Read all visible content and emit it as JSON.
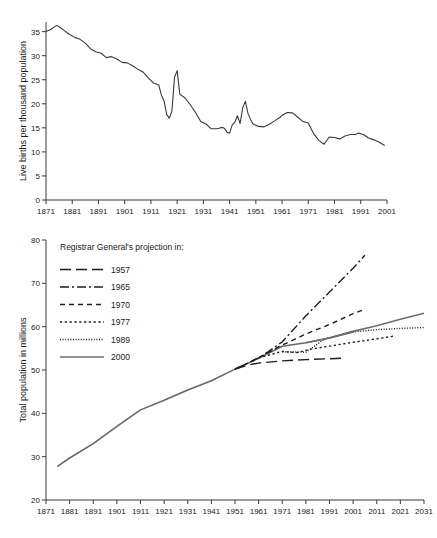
{
  "chart_data": [
    {
      "id": "birth-rate",
      "type": "line",
      "title": "",
      "xlabel": "",
      "ylabel": "Live births per thousand population",
      "xlim": [
        1871,
        2001
      ],
      "ylim": [
        0,
        37
      ],
      "yticks": [
        0,
        5,
        10,
        15,
        20,
        25,
        30,
        35
      ],
      "xticks": [
        1871,
        1881,
        1891,
        1901,
        1911,
        1921,
        1931,
        1941,
        1951,
        1961,
        1971,
        1981,
        1991,
        2001
      ],
      "grid": false,
      "legend": "none",
      "series": [
        {
          "name": "Live birth rate",
          "color": "#3a3a3a",
          "x": [
            1871,
            1873,
            1875,
            1876,
            1878,
            1880,
            1882,
            1884,
            1886,
            1888,
            1890,
            1892,
            1894,
            1896,
            1898,
            1900,
            1902,
            1904,
            1906,
            1908,
            1910,
            1912,
            1914,
            1915,
            1916,
            1917,
            1918,
            1919,
            1920,
            1921,
            1922,
            1924,
            1926,
            1928,
            1930,
            1932,
            1934,
            1936,
            1937,
            1938,
            1939,
            1940,
            1941,
            1942,
            1943,
            1944,
            1945,
            1946,
            1947,
            1948,
            1949,
            1950,
            1952,
            1954,
            1956,
            1958,
            1960,
            1961,
            1963,
            1965,
            1967,
            1969,
            1971,
            1973,
            1975,
            1977,
            1979,
            1981,
            1983,
            1985,
            1987,
            1989,
            1990,
            1992,
            1994,
            1996,
            1998,
            2000
          ],
          "values": [
            35.0,
            35.5,
            36.3,
            36.0,
            35.2,
            34.4,
            33.8,
            33.4,
            32.6,
            31.4,
            30.8,
            30.5,
            29.6,
            29.8,
            29.3,
            28.6,
            28.5,
            27.9,
            27.2,
            26.6,
            25.4,
            24.3,
            23.9,
            21.8,
            20.6,
            17.8,
            17.0,
            18.5,
            25.5,
            26.9,
            22.0,
            21.2,
            19.8,
            18.2,
            16.3,
            15.8,
            14.8,
            14.8,
            14.9,
            15.1,
            14.9,
            14.1,
            13.9,
            15.6,
            16.2,
            17.5,
            15.9,
            19.2,
            20.5,
            18.0,
            16.7,
            15.8,
            15.3,
            15.2,
            15.7,
            16.4,
            17.1,
            17.6,
            18.2,
            18.1,
            17.2,
            16.3,
            16.0,
            13.8,
            12.4,
            11.6,
            13.1,
            13.0,
            12.7,
            13.3,
            13.6,
            13.6,
            13.9,
            13.6,
            12.9,
            12.5,
            12.0,
            11.4
          ]
        }
      ]
    },
    {
      "id": "population-projections",
      "type": "line",
      "title": "",
      "xlabel": "",
      "ylabel": "Total population in millions",
      "xlim": [
        1871,
        2031
      ],
      "ylim": [
        20,
        80
      ],
      "yticks": [
        20,
        30,
        40,
        50,
        60,
        70,
        80
      ],
      "xticks": [
        1871,
        1881,
        1891,
        1901,
        1911,
        1921,
        1931,
        1941,
        1951,
        1961,
        1971,
        1981,
        1991,
        2001,
        2011,
        2021,
        2031
      ],
      "grid": false,
      "legend": "upper-left",
      "legend_title": "Registrar General's projection in:",
      "series": [
        {
          "name": "Historical",
          "legend_label": "",
          "style": "solid-gray",
          "color": "#6e6e6e",
          "in_legend": false,
          "x": [
            1876,
            1881,
            1891,
            1901,
            1911,
            1921,
            1931,
            1941,
            1951,
            1961,
            1971,
            1981,
            1991,
            2001
          ],
          "values": [
            27.8,
            29.7,
            33.0,
            37.0,
            40.8,
            43.0,
            45.4,
            47.5,
            50.2,
            52.7,
            55.5,
            56.3,
            57.4,
            58.8
          ]
        },
        {
          "name": "1957",
          "legend_label": "1957",
          "style": "long-dash",
          "color": "#1d1d1d",
          "in_legend": true,
          "x": [
            1951,
            1957,
            1961,
            1971,
            1981,
            1991,
            1996
          ],
          "values": [
            50.2,
            51.2,
            51.6,
            52.1,
            52.4,
            52.6,
            52.7
          ]
        },
        {
          "name": "1965",
          "legend_label": "1965",
          "style": "dash-dot",
          "color": "#1d1d1d",
          "in_legend": true,
          "x": [
            1951,
            1961,
            1965,
            1971,
            1981,
            1991,
            2001,
            2006
          ],
          "values": [
            50.2,
            52.8,
            54.2,
            56.5,
            62.5,
            68.0,
            73.5,
            76.5
          ]
        },
        {
          "name": "1970",
          "legend_label": "1970",
          "style": "dash",
          "color": "#1d1d1d",
          "in_legend": true,
          "x": [
            1951,
            1961,
            1970,
            1981,
            1991,
            2001,
            2005
          ],
          "values": [
            50.2,
            52.8,
            55.5,
            58.3,
            60.5,
            63.0,
            63.8
          ]
        },
        {
          "name": "1977",
          "legend_label": "1977",
          "style": "dot-coarse",
          "color": "#1d1d1d",
          "in_legend": true,
          "x": [
            1961,
            1971,
            1977,
            1984,
            1991,
            2001,
            2011,
            2018
          ],
          "values": [
            52.8,
            54.3,
            54.0,
            54.9,
            55.5,
            56.4,
            57.2,
            57.8
          ]
        },
        {
          "name": "1989",
          "legend_label": "1989",
          "style": "dot-fine",
          "color": "#1d1d1d",
          "in_legend": true,
          "x": [
            1971,
            1981,
            1989,
            2001,
            2011,
            2021,
            2031
          ],
          "values": [
            54.2,
            54.1,
            57.2,
            58.8,
            59.3,
            59.6,
            59.8
          ]
        },
        {
          "name": "2000",
          "legend_label": "2000",
          "style": "solid-gray",
          "color": "#6e6e6e",
          "in_legend": true,
          "x": [
            1981,
            1991,
            2000,
            2011,
            2021,
            2031
          ],
          "values": [
            56.3,
            57.4,
            58.8,
            60.2,
            61.7,
            63.1
          ]
        }
      ]
    }
  ]
}
